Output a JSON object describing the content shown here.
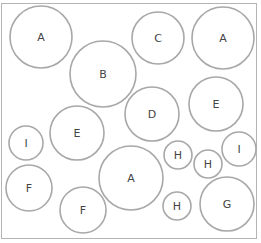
{
  "diagram": {
    "circles": [
      {
        "label": "A",
        "cx": 41,
        "cy": 37,
        "r": 31
      },
      {
        "label": "B",
        "cx": 103,
        "cy": 74,
        "r": 33
      },
      {
        "label": "C",
        "cx": 158,
        "cy": 38,
        "r": 26
      },
      {
        "label": "A",
        "cx": 223,
        "cy": 38,
        "r": 31
      },
      {
        "label": "D",
        "cx": 152,
        "cy": 114,
        "r": 27
      },
      {
        "label": "E",
        "cx": 216,
        "cy": 104,
        "r": 27
      },
      {
        "label": "I",
        "cx": 26,
        "cy": 143,
        "r": 17
      },
      {
        "label": "E",
        "cx": 77,
        "cy": 133,
        "r": 27
      },
      {
        "label": "F",
        "cx": 29,
        "cy": 188,
        "r": 23
      },
      {
        "label": "A",
        "cx": 131,
        "cy": 178,
        "r": 32
      },
      {
        "label": "H",
        "cx": 178,
        "cy": 155,
        "r": 14
      },
      {
        "label": "H",
        "cx": 208,
        "cy": 164,
        "r": 14
      },
      {
        "label": "I",
        "cx": 239,
        "cy": 149,
        "r": 17
      },
      {
        "label": "F",
        "cx": 83,
        "cy": 210,
        "r": 23
      },
      {
        "label": "H",
        "cx": 177,
        "cy": 206,
        "r": 14
      },
      {
        "label": "G",
        "cx": 227,
        "cy": 204,
        "r": 27
      }
    ]
  }
}
